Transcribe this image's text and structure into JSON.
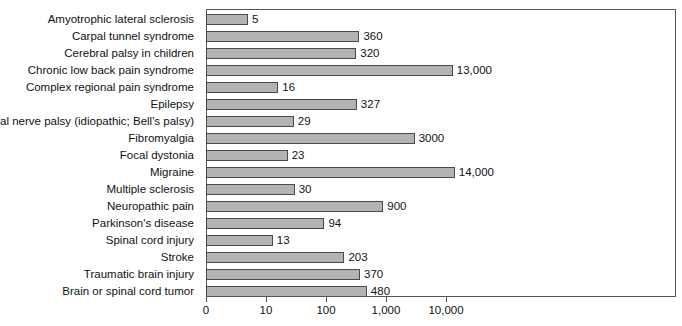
{
  "chart_data": {
    "type": "bar",
    "orientation": "horizontal",
    "title": "",
    "subtitle": "",
    "xlabel": "",
    "ylabel": "",
    "xscale": "log",
    "grid": false,
    "legend": null,
    "xticks": [
      "0",
      "10",
      "100",
      "1,000",
      "10,000"
    ],
    "xtick_values": [
      0,
      10,
      100,
      1000,
      10000
    ],
    "categories": [
      "Amyotrophic lateral sclerosis",
      "Carpal tunnel syndrome",
      "Cerebral palsy in children",
      "Chronic low back pain syndrome",
      "Complex regional pain syndrome",
      "Epilepsy",
      "Facial nerve palsy (idiopathic; Bell's palsy)",
      "Fibromyalgia",
      "Focal dystonia",
      "Migraine",
      "Multiple sclerosis",
      "Neuropathic pain",
      "Parkinson's disease",
      "Spinal cord injury",
      "Stroke",
      "Traumatic brain injury",
      "Brain or spinal cord tumor"
    ],
    "values": [
      5,
      360,
      320,
      13000,
      16,
      327,
      29,
      3000,
      23,
      14000,
      30,
      900,
      94,
      13,
      203,
      370,
      480
    ],
    "value_labels": [
      "5",
      "360",
      "320",
      "13,000",
      "16",
      "327",
      "29",
      "3000",
      "23",
      "14,000",
      "30",
      "900",
      "94",
      "13",
      "203",
      "370",
      "480"
    ],
    "bar_fill": "#b3b3b3",
    "bar_edge": "#4a4a4a",
    "axis_color": "#555555",
    "background": "#ffffff"
  }
}
